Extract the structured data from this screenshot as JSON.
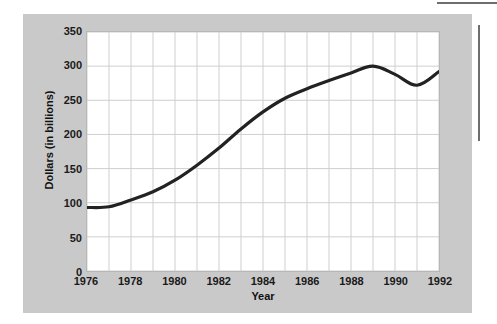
{
  "figure": {
    "panel_color": "#c9c9c9",
    "plot_background": "#ffffff",
    "grid_color": "#cfcfcf",
    "line_color": "#222222",
    "rule_color": "#6e6e6e"
  },
  "chart_data": {
    "type": "line",
    "title": "",
    "xlabel": "Year",
    "ylabel": "Dollars (in billions)",
    "xlim": [
      1976,
      1992
    ],
    "ylim": [
      0,
      350
    ],
    "grid": true,
    "legend": "none",
    "x_tick_labels": [
      "1976",
      "1978",
      "1980",
      "1982",
      "1984",
      "1986",
      "1988",
      "1990",
      "1992"
    ],
    "x_tick_values": [
      1976,
      1978,
      1980,
      1982,
      1984,
      1986,
      1988,
      1990,
      1992
    ],
    "x_minor_gridlines": [
      1977,
      1979,
      1981,
      1983,
      1985,
      1987,
      1989,
      1991
    ],
    "y_tick_labels": [
      "0",
      "50",
      "100",
      "150",
      "200",
      "250",
      "300",
      "350"
    ],
    "y_tick_values": [
      0,
      50,
      100,
      150,
      200,
      250,
      300,
      350
    ],
    "x": [
      1976,
      1977,
      1978,
      1979,
      1980,
      1981,
      1982,
      1983,
      1984,
      1985,
      1986,
      1987,
      1988,
      1989,
      1990,
      1991,
      1992
    ],
    "values": [
      93,
      94,
      104,
      116,
      133,
      155,
      180,
      208,
      233,
      253,
      267,
      279,
      290,
      300,
      288,
      272,
      292
    ],
    "series": [
      {
        "name": "Dollars (in billions)",
        "values": [
          93,
          94,
          104,
          116,
          133,
          155,
          180,
          208,
          233,
          253,
          267,
          279,
          290,
          300,
          288,
          272,
          292
        ]
      }
    ]
  }
}
